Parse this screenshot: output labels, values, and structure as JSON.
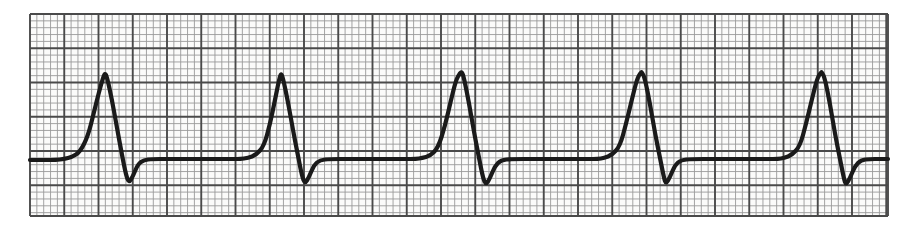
{
  "document": {
    "kind": "ecg-rhythm-strip",
    "title": "ECG Rhythm Strip",
    "description": "Single-lead electrocardiogram rhythm strip printed on standard pink/grey ECG graph paper, showing five consecutive normal sinus QRS complexes at regular intervals.",
    "background_color": "#ffffff"
  },
  "paper": {
    "name": "ecg-graph-paper",
    "origin_x": 30,
    "origin_y": 14,
    "width": 858,
    "height": 202,
    "paper_fill": "#fbfbfa",
    "minor_square_px": 6.85,
    "major_square_px": 34.25,
    "minor_line_color": "#9a9a9a",
    "major_line_color": "#4a4a4a",
    "minor_line_width": 0.9,
    "major_line_width": 1.9,
    "minor_cols": 125,
    "minor_rows": 30
  },
  "trace": {
    "name": "ecg-waveform",
    "color": "#1a1a1a",
    "line_width": 4.2,
    "baseline_y": 160,
    "start_x": 30,
    "end_x": 888
  },
  "chart_data": {
    "type": "line",
    "subtitle": "Normal sinus rhythm, single lead",
    "xlabel": "Time",
    "ylabel": "Amplitude",
    "xlim": [
      30,
      888
    ],
    "ylim": [
      216,
      14
    ],
    "grid": true,
    "legend_position": "none",
    "axis_ticks_visible": false,
    "tick_labels_visible": false,
    "baseline_y": 160,
    "beat_count": 5,
    "rr_interval_px": 180,
    "r_peak_y": 73,
    "s_trough_y": 183,
    "r_peak_x": [
      105,
      281,
      462,
      642,
      822
    ],
    "complexes": [
      {
        "index": 1,
        "p_onset_x": 62,
        "q_x": 96,
        "r_peak_x": 105,
        "s_trough_x": 129,
        "return_x": 150,
        "r_peak_y": 73,
        "s_trough_y": 183
      },
      {
        "index": 2,
        "p_onset_x": 240,
        "q_x": 272,
        "r_peak_x": 281,
        "s_trough_x": 305,
        "return_x": 326,
        "r_peak_y": 73,
        "s_trough_y": 184
      },
      {
        "index": 3,
        "p_onset_x": 420,
        "q_x": 453,
        "r_peak_x": 462,
        "s_trough_x": 486,
        "return_x": 507,
        "r_peak_y": 72,
        "s_trough_y": 185
      },
      {
        "index": 4,
        "p_onset_x": 600,
        "q_x": 633,
        "r_peak_x": 642,
        "s_trough_x": 666,
        "return_x": 687,
        "r_peak_y": 72,
        "s_trough_y": 184
      },
      {
        "index": 5,
        "p_onset_x": 780,
        "q_x": 813,
        "r_peak_x": 822,
        "s_trough_x": 846,
        "return_x": 867,
        "r_peak_y": 72,
        "s_trough_y": 185
      }
    ],
    "series": [
      {
        "name": "lead-trace",
        "points": [
          [
            30,
            160
          ],
          [
            44,
            160
          ],
          [
            56,
            160
          ],
          [
            64,
            159
          ],
          [
            72,
            157
          ],
          [
            80,
            152
          ],
          [
            88,
            136
          ],
          [
            94,
            112
          ],
          [
            99,
            92
          ],
          [
            103,
            78
          ],
          [
            105,
            73
          ],
          [
            107,
            77
          ],
          [
            112,
            100
          ],
          [
            117,
            128
          ],
          [
            122,
            155
          ],
          [
            126,
            175
          ],
          [
            129,
            183
          ],
          [
            133,
            176
          ],
          [
            138,
            164
          ],
          [
            144,
            160
          ],
          [
            152,
            159
          ],
          [
            168,
            159
          ],
          [
            190,
            159
          ],
          [
            215,
            159
          ],
          [
            234,
            159
          ],
          [
            240,
            159
          ],
          [
            248,
            158
          ],
          [
            256,
            155
          ],
          [
            264,
            146
          ],
          [
            270,
            124
          ],
          [
            275,
            100
          ],
          [
            279,
            80
          ],
          [
            281,
            73
          ],
          [
            283,
            78
          ],
          [
            288,
            102
          ],
          [
            293,
            130
          ],
          [
            298,
            156
          ],
          [
            302,
            176
          ],
          [
            305,
            184
          ],
          [
            309,
            177
          ],
          [
            314,
            165
          ],
          [
            320,
            160
          ],
          [
            330,
            159
          ],
          [
            350,
            159
          ],
          [
            380,
            159
          ],
          [
            405,
            159
          ],
          [
            416,
            159
          ],
          [
            422,
            158
          ],
          [
            430,
            156
          ],
          [
            438,
            148
          ],
          [
            445,
            126
          ],
          [
            451,
            100
          ],
          [
            456,
            80
          ],
          [
            460,
            73
          ],
          [
            462,
            72
          ],
          [
            464,
            78
          ],
          [
            469,
            103
          ],
          [
            474,
            132
          ],
          [
            479,
            158
          ],
          [
            483,
            178
          ],
          [
            486,
            185
          ],
          [
            490,
            178
          ],
          [
            495,
            166
          ],
          [
            501,
            160
          ],
          [
            512,
            159
          ],
          [
            535,
            159
          ],
          [
            565,
            159
          ],
          [
            588,
            159
          ],
          [
            598,
            159
          ],
          [
            604,
            158
          ],
          [
            612,
            155
          ],
          [
            620,
            146
          ],
          [
            626,
            124
          ],
          [
            632,
            99
          ],
          [
            637,
            79
          ],
          [
            641,
            72
          ],
          [
            642,
            72
          ],
          [
            645,
            79
          ],
          [
            650,
            104
          ],
          [
            655,
            133
          ],
          [
            660,
            158
          ],
          [
            664,
            178
          ],
          [
            666,
            184
          ],
          [
            670,
            177
          ],
          [
            675,
            165
          ],
          [
            681,
            160
          ],
          [
            692,
            159
          ],
          [
            715,
            159
          ],
          [
            745,
            159
          ],
          [
            768,
            159
          ],
          [
            778,
            159
          ],
          [
            784,
            158
          ],
          [
            792,
            155
          ],
          [
            800,
            146
          ],
          [
            806,
            124
          ],
          [
            812,
            99
          ],
          [
            817,
            79
          ],
          [
            821,
            72
          ],
          [
            822,
            72
          ],
          [
            825,
            79
          ],
          [
            830,
            104
          ],
          [
            835,
            134
          ],
          [
            840,
            159
          ],
          [
            844,
            179
          ],
          [
            846,
            185
          ],
          [
            850,
            178
          ],
          [
            855,
            166
          ],
          [
            861,
            160
          ],
          [
            870,
            159
          ],
          [
            880,
            159
          ],
          [
            888,
            159
          ]
        ]
      }
    ]
  }
}
